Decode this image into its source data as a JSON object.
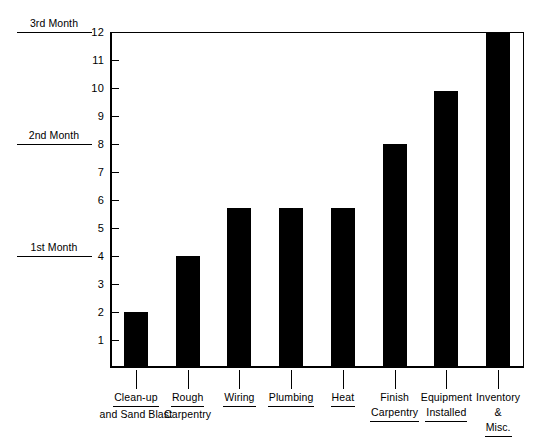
{
  "chart_data": {
    "type": "bar",
    "title": "",
    "xlabel": "",
    "ylabel": "",
    "ylim": [
      0,
      12
    ],
    "grid": false,
    "legend": "none",
    "orientation": "vertical",
    "bar_color": "#000000",
    "categories": [
      "Clean-up and Sand Blast",
      "Rough Carpentry",
      "Wiring",
      "Plumbing",
      "Heat",
      "Finish Carpentry",
      "Equipment Installed",
      "Inventory & Misc."
    ],
    "values": [
      2,
      4,
      5.7,
      5.7,
      5.7,
      8,
      9.9,
      12
    ],
    "ytick_labels": [
      "1",
      "2",
      "3",
      "4",
      "5",
      "6",
      "7",
      "8",
      "9",
      "10",
      "11",
      "12"
    ],
    "ytick_values": [
      1,
      2,
      3,
      4,
      5,
      6,
      7,
      8,
      9,
      10,
      11,
      12
    ],
    "annotations": [
      {
        "text": "1st Month",
        "value": 4
      },
      {
        "text": "2nd Month",
        "value": 8
      },
      {
        "text": "3rd Month",
        "value": 12
      }
    ]
  },
  "axis": {
    "month_markers": [
      {
        "label": "3rd Month",
        "value": 12
      },
      {
        "label": "2nd Month",
        "value": 8
      },
      {
        "label": "1st Month",
        "value": 4
      }
    ],
    "y_ticks": [
      {
        "label": "12",
        "value": 12
      },
      {
        "label": "11",
        "value": 11
      },
      {
        "label": "10",
        "value": 10
      },
      {
        "label": "9",
        "value": 9
      },
      {
        "label": "8",
        "value": 8
      },
      {
        "label": "7",
        "value": 7
      },
      {
        "label": "6",
        "value": 6
      },
      {
        "label": "5",
        "value": 5
      },
      {
        "label": "4",
        "value": 4
      },
      {
        "label": "3",
        "value": 3
      },
      {
        "label": "2",
        "value": 2
      },
      {
        "label": "1",
        "value": 1
      }
    ]
  },
  "bars": [
    {
      "value": 2,
      "lines": [
        {
          "text": "Clean-up",
          "underlined": true
        },
        {
          "text": "and Sand Blast",
          "underlined": false
        }
      ]
    },
    {
      "value": 4,
      "lines": [
        {
          "text": "Rough",
          "underlined": true
        },
        {
          "text": "Carpentry",
          "underlined": false
        }
      ]
    },
    {
      "value": 5.7,
      "lines": [
        {
          "text": "Wiring",
          "underlined": true
        }
      ]
    },
    {
      "value": 5.7,
      "lines": [
        {
          "text": "Plumbing",
          "underlined": true
        }
      ]
    },
    {
      "value": 5.7,
      "lines": [
        {
          "text": "Heat",
          "underlined": true
        }
      ]
    },
    {
      "value": 8,
      "lines": [
        {
          "text": "Finish",
          "underlined": false
        },
        {
          "text": "Carpentry",
          "underlined": true
        }
      ]
    },
    {
      "value": 9.9,
      "lines": [
        {
          "text": "Equipment",
          "underlined": false
        },
        {
          "text": "Installed",
          "underlined": true
        }
      ]
    },
    {
      "value": 12,
      "lines": [
        {
          "text": "Inventory",
          "underlined": false
        },
        {
          "text": "&",
          "underlined": false
        },
        {
          "text": "Misc.",
          "underlined": true
        }
      ]
    }
  ]
}
